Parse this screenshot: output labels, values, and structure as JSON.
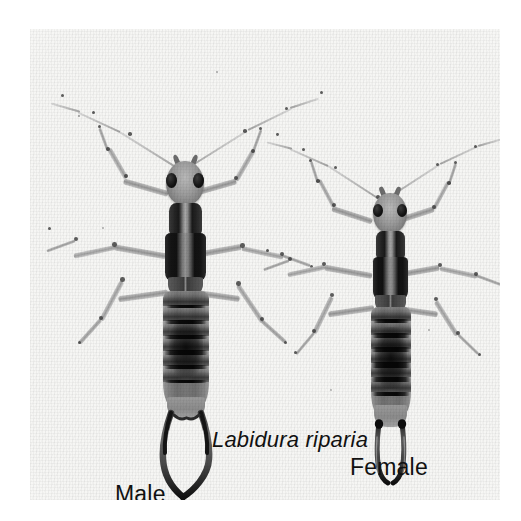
{
  "figure": {
    "kind": "photographic-plate",
    "background_color": "#ffffff",
    "plate_color": "#f6f6f4"
  },
  "captions": {
    "species": "Labidura riparia",
    "male": "Male",
    "female": "Female"
  },
  "specimens": [
    {
      "id": "male",
      "label": "Male",
      "position": "left",
      "distinguishing_feature": "long, strongly curved forceps forming a wide loop"
    },
    {
      "id": "female",
      "label": "Female",
      "position": "right",
      "distinguishing_feature": "short, straight, nearly parallel forceps"
    }
  ],
  "colors": {
    "text": "#111111",
    "eye": "#000000",
    "body_dark": "#141414",
    "body_mid": "#7c7c7c",
    "body_light": "#b9b9b9",
    "background": "#f6f6f4"
  }
}
